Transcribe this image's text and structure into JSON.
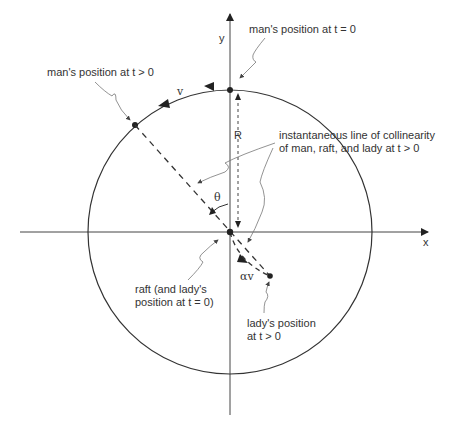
{
  "diagram": {
    "type": "geometry-figure",
    "axes": {
      "x_label": "x",
      "y_label": "y"
    },
    "circle": {
      "radius_label": "R"
    },
    "symbols": {
      "speed_man": "v",
      "speed_lady": "αv",
      "angle": "θ"
    },
    "annotations": {
      "man_t0": "man's position at t = 0",
      "man_t": "man's position at t > 0",
      "collinear_line1": "instantaneous line of collinearity",
      "collinear_line2": "of man, raft, and lady at t > 0",
      "raft_line1": "raft (and lady's",
      "raft_line2": "position at t = 0)",
      "lady_line1": "lady's position",
      "lady_line2": "at t > 0"
    },
    "colors": {
      "ink": "#333333",
      "leader": "#666666",
      "background": "#ffffff"
    }
  }
}
